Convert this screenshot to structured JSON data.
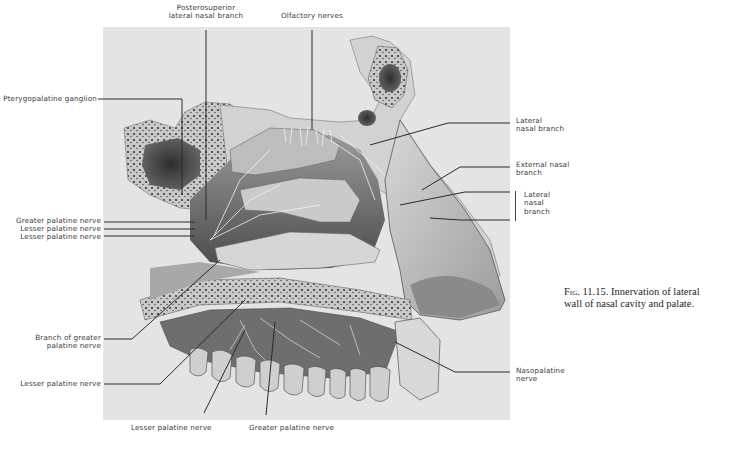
{
  "figure": {
    "number": "Fig. 11.15.",
    "caption": "Innervation of lateral wall of nasal cavity and palate.",
    "caption_line1": "Innervation of lateral",
    "caption_line2": "wall of nasal cavity and palate."
  },
  "labels": {
    "top": [
      {
        "id": "posterosuperior",
        "line1": "Posterosuperior",
        "line2": "lateral nasal branch"
      },
      {
        "id": "olfactory",
        "line1": "Olfactory nerves"
      }
    ],
    "left": [
      {
        "id": "pterygopalatine",
        "text": "Pterygopalatine ganglion"
      },
      {
        "id": "greater-palatine-1",
        "text": "Greater palatine nerve"
      },
      {
        "id": "lesser-palatine-1",
        "text": "Lesser palatine nerve"
      },
      {
        "id": "lesser-palatine-2",
        "text": "Lesser palatine nerve"
      },
      {
        "id": "branch-greater",
        "line1": "Branch of greater",
        "line2": "palatine nerve"
      },
      {
        "id": "lesser-palatine-3",
        "text": "Lesser palatine nerve"
      }
    ],
    "right": [
      {
        "id": "lateral-nasal-1",
        "line1": "Lateral",
        "line2": "nasal branch"
      },
      {
        "id": "external-nasal",
        "line1": "External nasal",
        "line2": "branch"
      },
      {
        "id": "lateral-nasal-2",
        "line1": "Lateral",
        "line2": "nasal",
        "line3": "branch"
      },
      {
        "id": "nasopalatine",
        "line1": "Nasopalatine",
        "line2": "nerve"
      }
    ],
    "bottom": [
      {
        "id": "lesser-palatine-4",
        "text": "Lesser palatine nerve"
      },
      {
        "id": "greater-palatine-2",
        "text": "Greater palatine nerve"
      }
    ]
  },
  "colors": {
    "panel": "#e4e4e4",
    "ink": "#2a2a2a",
    "bone": "#cfcfcf",
    "dark": "#3c3c3c"
  }
}
